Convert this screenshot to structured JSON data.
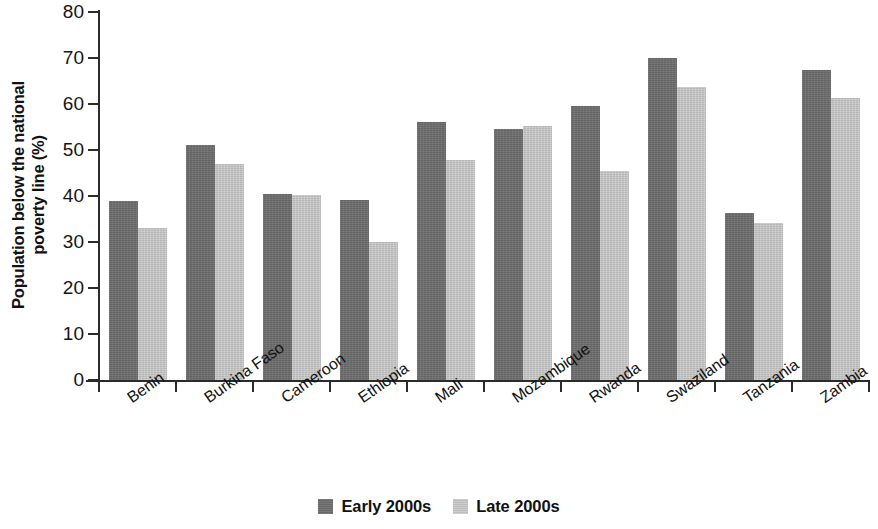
{
  "chart_data": {
    "type": "bar",
    "title": "",
    "subtitle": "",
    "xlabel": "",
    "ylabel": "Population below the national poverty line (%)",
    "ylabel_lines": [
      "Population below the national",
      "poverty line (%)"
    ],
    "ylim": [
      0,
      80
    ],
    "ytick_values": [
      0,
      10,
      20,
      30,
      40,
      50,
      60,
      70,
      80
    ],
    "ytick_labels": [
      "0",
      "10",
      "20",
      "30",
      "40",
      "50",
      "60",
      "70",
      "80"
    ],
    "grid": false,
    "legend_position": "bottom-center",
    "categories": [
      "Benin",
      "Burkina Faso",
      "Cameroon",
      "Ethiopia",
      "Mali",
      "Mozambique",
      "Rwanda",
      "Swaziland",
      "Tanzania",
      "Zambia"
    ],
    "series": [
      {
        "name": "Early 2000s",
        "color": "#6e6e6e",
        "values": [
          39.0,
          51.1,
          40.4,
          39.2,
          56.1,
          54.5,
          59.5,
          69.9,
          36.4,
          67.3
        ]
      },
      {
        "name": "Late 2000s",
        "color": "#c6c6c6",
        "values": [
          33.1,
          46.9,
          40.2,
          30.0,
          47.8,
          55.2,
          45.5,
          63.8,
          34.2,
          61.3
        ]
      }
    ]
  },
  "legend": {
    "items": [
      {
        "label": "Early 2000s",
        "swatch": "early"
      },
      {
        "label": "Late 2000s",
        "swatch": "late"
      }
    ]
  }
}
